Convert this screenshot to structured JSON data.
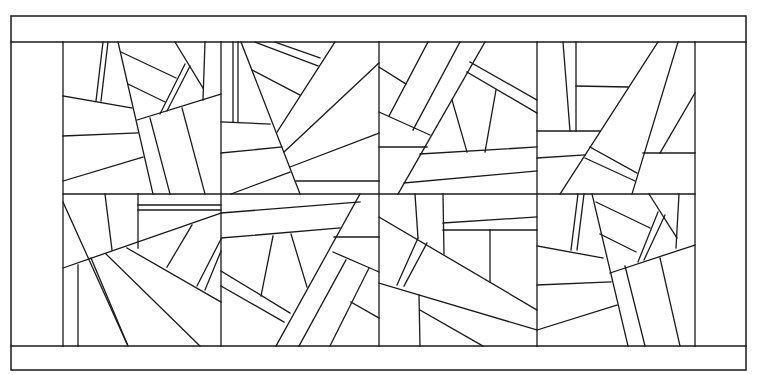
{
  "figure": {
    "type": "line-art quilt / stained-glass panel pattern",
    "width": 762,
    "height": 375,
    "line_color": "#1a1a1a",
    "background": "#ffffff",
    "outer_frame": {
      "x1": 11,
      "y1": 16,
      "x2": 746,
      "y2": 370
    },
    "top_band": {
      "y1": 16,
      "y2": 42
    },
    "bottom_band": {
      "y1": 346,
      "y2": 370
    },
    "left_border": {
      "x1": 11,
      "x2": 63
    },
    "right_border": {
      "x1": 695,
      "x2": 746
    },
    "grid": {
      "columns": [
        63,
        221,
        379,
        537,
        695
      ],
      "rows": [
        42,
        194,
        346
      ],
      "block_count": 8
    }
  },
  "blocks": [
    {
      "name": "block-r1-c1",
      "lines": [
        [
          97,
          42,
          92,
          152
        ],
        [
          103,
          42,
          98,
          152
        ],
        [
          63,
          148,
          132,
          160
        ],
        [
          120,
          42,
          155,
          188
        ],
        [
          120,
          50,
          176,
          78
        ],
        [
          128,
          85,
          165,
          102
        ],
        [
          63,
          202,
          138,
          195
        ],
        [
          138,
          120,
          221,
          94
        ],
        [
          150,
          190,
          160,
          258
        ],
        [
          138,
          120,
          160,
          258
        ],
        [
          165,
          101,
          190,
          42
        ],
        [
          175,
          78,
          187,
          62
        ],
        [
          160,
          112,
          185,
          62
        ],
        [
          168,
          110,
          192,
          60
        ],
        [
          203,
          42,
          200,
          90
        ],
        [
          63,
          232,
          142,
          210
        ],
        [
          198,
          115,
          222,
          188
        ]
      ]
    },
    {
      "name": "block-r2-c1",
      "lines": []
    }
  ]
}
